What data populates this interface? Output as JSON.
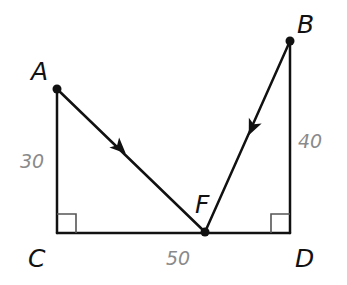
{
  "diagram": {
    "points": {
      "A": {
        "label": "A",
        "x": 57,
        "y": 89
      },
      "B": {
        "label": "B",
        "x": 290,
        "y": 41
      },
      "C": {
        "label": "C",
        "x": 57,
        "y": 233
      },
      "D": {
        "label": "D",
        "x": 290,
        "y": 233
      },
      "F": {
        "label": "F",
        "x": 205,
        "y": 232
      }
    },
    "lengths": {
      "AC": "30",
      "BD": "40",
      "CD": "50"
    },
    "segments": [
      {
        "from": "A",
        "to": "C"
      },
      {
        "from": "C",
        "to": "D"
      },
      {
        "from": "B",
        "to": "D"
      },
      {
        "from": "A",
        "to": "F",
        "arrow": "toward F"
      },
      {
        "from": "B",
        "to": "F",
        "arrow": "toward F"
      }
    ],
    "right_angles": [
      "C",
      "D"
    ],
    "colors": {
      "line": "#111111",
      "length_label": "#8a8a8a",
      "right_angle_mark": "#555555"
    }
  }
}
